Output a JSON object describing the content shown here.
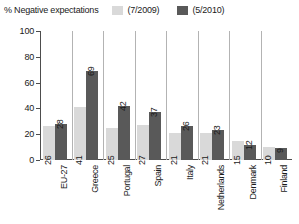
{
  "legend": {
    "title": "% Negative expectations",
    "entries": [
      {
        "label": "(7/2009)",
        "color": "#d9d9d9",
        "swatch_name": "legend-swatch-2009"
      },
      {
        "label": "(5/2010)",
        "color": "#595959",
        "swatch_name": "legend-swatch-2010"
      }
    ]
  },
  "axis": {
    "ticks": [
      "0",
      "20",
      "40",
      "60",
      "80",
      "100"
    ]
  },
  "chart_data": {
    "type": "bar",
    "title": "% Negative expectations",
    "xlabel": "",
    "ylabel": "",
    "ylim": [
      0,
      100
    ],
    "yticks": [
      0,
      20,
      40,
      60,
      80,
      100
    ],
    "grid": false,
    "legend_position": "top",
    "categories": [
      "EU-27",
      "Greece",
      "Portugal",
      "Spain",
      "Italy",
      "Netherlands",
      "Denmark",
      "Finland"
    ],
    "series": [
      {
        "name": "(7/2009)",
        "color": "#d9d9d9",
        "values": [
          26,
          41,
          25,
          27,
          21,
          21,
          15,
          10
        ]
      },
      {
        "name": "(5/2010)",
        "color": "#595959",
        "values": [
          28,
          69,
          42,
          37,
          26,
          23,
          12,
          9
        ]
      }
    ]
  }
}
